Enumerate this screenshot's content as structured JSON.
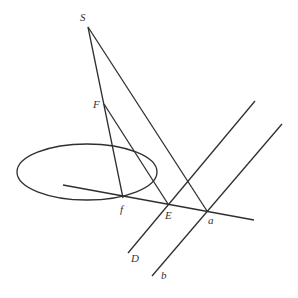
{
  "diagram": {
    "type": "perspective-geometry",
    "colors": {
      "stroke": "#2f2f2f",
      "label": "#333333",
      "background": "#ffffff"
    },
    "labels": {
      "S": "S",
      "F": "F",
      "f": "f",
      "E": "E",
      "a": "a",
      "D": "D",
      "b": "b"
    },
    "points": {
      "S": [
        88,
        27
      ],
      "F": [
        104,
        104
      ],
      "f": [
        123,
        198
      ],
      "E": [
        168,
        204
      ],
      "a": [
        207,
        211
      ]
    },
    "ellipse": {
      "cx": 87,
      "cy": 172,
      "rx": 70,
      "ry": 28
    },
    "lines": [
      {
        "name": "horizon-line",
        "from": [
          63,
          185
        ],
        "to": [
          254,
          220
        ]
      },
      {
        "name": "line-S-f",
        "from": [
          88,
          27
        ],
        "to": [
          123,
          198
        ]
      },
      {
        "name": "line-S-a",
        "from": [
          88,
          27
        ],
        "to": [
          207,
          211
        ]
      },
      {
        "name": "line-F-E",
        "from": [
          104,
          104
        ],
        "to": [
          168,
          204
        ]
      },
      {
        "name": "line-D",
        "from": [
          128,
          253
        ],
        "to": [
          255,
          101
        ]
      },
      {
        "name": "line-b",
        "from": [
          152,
          276
        ],
        "to": [
          282,
          124
        ]
      }
    ]
  }
}
